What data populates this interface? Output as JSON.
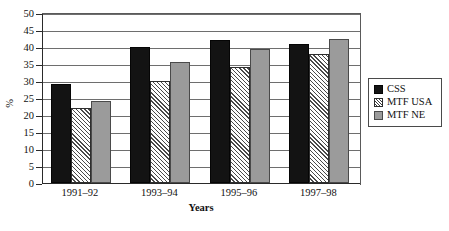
{
  "chart_data": {
    "type": "bar",
    "title": "",
    "xlabel": "Years",
    "ylabel": "%",
    "ylim": [
      0,
      50
    ],
    "yticks": [
      0,
      5,
      10,
      15,
      20,
      25,
      30,
      35,
      40,
      45,
      50
    ],
    "grid": true,
    "legend_position": "right",
    "categories": [
      "1991–92",
      "1993–94",
      "1995–96",
      "1997–98"
    ],
    "series": [
      {
        "name": "CSS",
        "color": "#131313",
        "pattern": "solid-black",
        "values": [
          29,
          40,
          42,
          41
        ]
      },
      {
        "name": "MTF USA",
        "color": "#ffffff",
        "pattern": "diagonal-hatch",
        "values": [
          22,
          30,
          34,
          38
        ]
      },
      {
        "name": "MTF NE",
        "color": "#9b9b9b",
        "pattern": "solid-gray",
        "values": [
          24,
          35.5,
          39.5,
          42.5
        ]
      }
    ]
  },
  "axes": {
    "y_title": "%",
    "x_title": "Years",
    "y_tick_labels": [
      "0",
      "5",
      "10",
      "15",
      "20",
      "25",
      "30",
      "35",
      "40",
      "45",
      "50"
    ],
    "x_tick_labels": [
      "1991–92",
      "1993–94",
      "1995–96",
      "1997–98"
    ]
  },
  "legend": {
    "items": [
      {
        "label": "CSS"
      },
      {
        "label": "MTF USA"
      },
      {
        "label": "MTF NE"
      }
    ]
  }
}
